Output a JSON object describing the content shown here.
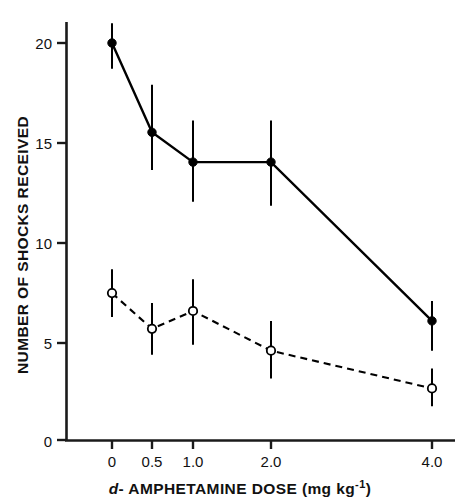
{
  "chart_data": {
    "type": "line",
    "title": "",
    "xlabel": "d-AMPHETAMINE DOSE (mg kg⁻¹)",
    "ylabel": "NUMBER OF SHOCKS RECEIVED",
    "categories": [
      "0",
      "0.5",
      "1.0",
      "2.0",
      "4.0"
    ],
    "x_tick_labels": [
      "0",
      "0.5",
      "1.0",
      "2.0",
      "4.0"
    ],
    "y_tick_labels": [
      "0",
      "5",
      "10",
      "15",
      "20"
    ],
    "y_ticks": [
      0,
      5,
      10,
      15,
      20
    ],
    "ylim": [
      0,
      21
    ],
    "grid": false,
    "legend_position": "none",
    "series": [
      {
        "name": "solid-filled-circle-series",
        "marker": "filled-circle",
        "line_style": "solid",
        "color": "#000000",
        "values": [
          20.0,
          15.5,
          14.0,
          14.0,
          6.0
        ],
        "error_low": [
          18.7,
          13.6,
          12.0,
          11.8,
          4.5
        ],
        "error_high": [
          21.0,
          17.9,
          16.1,
          16.1,
          7.0
        ]
      },
      {
        "name": "dashed-open-circle-series",
        "marker": "open-circle",
        "line_style": "dashed",
        "color": "#000000",
        "values": [
          7.4,
          5.6,
          6.5,
          4.5,
          2.6
        ],
        "error_low": [
          6.2,
          4.3,
          4.8,
          3.1,
          1.7
        ],
        "error_high": [
          8.6,
          6.9,
          8.1,
          6.0,
          3.6
        ]
      }
    ],
    "annotations": []
  },
  "axes": {
    "x_axis_title_prefix_italic": "d",
    "x_axis_title_rest": "- AMPHETAMINE  DOSE  (mg kg",
    "x_axis_title_superscript": "-1",
    "x_axis_title_suffix": ")",
    "y_axis_title": "NUMBER OF SHOCKS RECEIVED"
  },
  "style": {
    "axis_color": "#1a1a1a",
    "line_color": "#111111",
    "background": "#ffffff"
  }
}
